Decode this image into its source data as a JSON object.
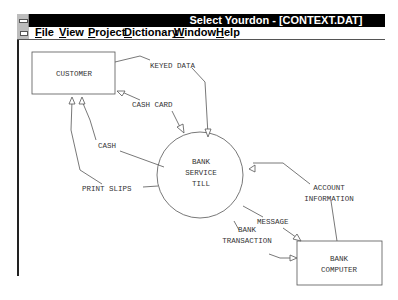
{
  "window": {
    "title": "Select Yourdon - [CONTEXT.DAT]"
  },
  "menubar": {
    "items": [
      {
        "label": "File",
        "key": "F",
        "rest": "ile"
      },
      {
        "label": "View",
        "key": "V",
        "rest": "iew"
      },
      {
        "label": "Project",
        "key": "P",
        "rest": "roject"
      },
      {
        "label": "Dictionary",
        "key": "D",
        "rest": "ictionary"
      },
      {
        "label": "Window",
        "key": "W",
        "rest": "indow"
      },
      {
        "label": "Help",
        "key": "H",
        "rest": "elp"
      }
    ]
  },
  "diagram": {
    "terminators": [
      {
        "label": "CUSTOMER"
      },
      {
        "label": "BANK",
        "label2": "COMPUTER"
      }
    ],
    "process": {
      "line1": "BANK",
      "line2": "SERVICE",
      "line3": "TILL"
    },
    "flows": {
      "keyed_data": "KEYED DATA",
      "cash_card": "CASH CARD",
      "cash": "CASH",
      "print_slips": "PRINT SLIPS",
      "account_information_1": "ACCOUNT",
      "account_information_2": "INFORMATION",
      "message": "MESSAGE",
      "bank_transaction_1": "BANK",
      "bank_transaction_2": "TRANSACTION"
    }
  }
}
